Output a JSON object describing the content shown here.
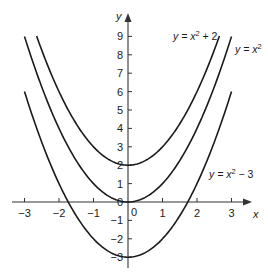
{
  "chart_data": {
    "type": "line",
    "title": "",
    "xlabel": "x",
    "ylabel": "y",
    "xlim": [
      -3,
      3
    ],
    "ylim": [
      -3,
      9
    ],
    "grid": false,
    "legend": "inline labels near curves",
    "x_ticks": [
      -3,
      -2,
      -1,
      0,
      1,
      2,
      3
    ],
    "x_tick_labels": [
      "−3",
      "−2",
      "−1",
      "0",
      "1",
      "2",
      "3"
    ],
    "y_ticks": [
      -3,
      -2,
      -1,
      0,
      1,
      2,
      3,
      4,
      5,
      6,
      7,
      8,
      9
    ],
    "y_tick_labels": [
      "−3",
      "−2",
      "−1",
      "0",
      "1",
      "2",
      "3",
      "4",
      "5",
      "6",
      "7",
      "8",
      "9"
    ],
    "series": [
      {
        "name": "y = x² + 2",
        "label_text": "y = x",
        "label_exp": "2",
        "label_tail": " + 2",
        "shift": 2,
        "x_range": [
          -2.65,
          2.65
        ],
        "vertex": [
          0,
          2
        ]
      },
      {
        "name": "y = x²",
        "label_text": "y = x",
        "label_exp": "2",
        "label_tail": "",
        "shift": 0,
        "x_range": [
          -3,
          3
        ],
        "vertex": [
          0,
          0
        ]
      },
      {
        "name": "y = x² − 3",
        "label_text": "y = x",
        "label_exp": "2",
        "label_tail": " − 3",
        "shift": -3,
        "x_range": [
          -3,
          3
        ],
        "vertex": [
          0,
          -3
        ]
      }
    ],
    "colors": {
      "curve": "#1a1a1a",
      "axis": "#333333"
    }
  }
}
